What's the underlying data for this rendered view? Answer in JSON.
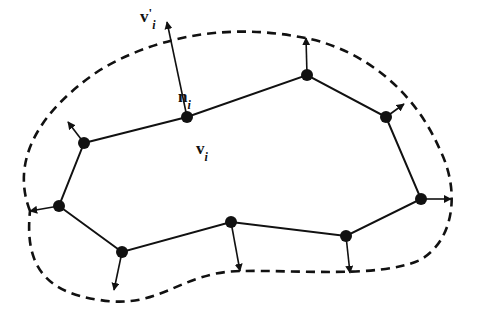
{
  "diagram": {
    "type": "snake-contour-normal-displacement",
    "colors": {
      "stroke": "#111111",
      "background": "#ffffff",
      "node": "#111111"
    },
    "nodes": [
      {
        "id": "v1",
        "x": 84,
        "y": 143
      },
      {
        "id": "v2",
        "x": 187,
        "y": 117
      },
      {
        "id": "v3",
        "x": 307,
        "y": 75
      },
      {
        "id": "v4",
        "x": 386,
        "y": 117
      },
      {
        "id": "v5",
        "x": 421,
        "y": 199
      },
      {
        "id": "v6",
        "x": 346,
        "y": 236
      },
      {
        "id": "v7",
        "x": 231,
        "y": 222
      },
      {
        "id": "v8",
        "x": 122,
        "y": 252
      },
      {
        "id": "v9",
        "x": 59,
        "y": 206
      }
    ],
    "normals": [
      {
        "from": "v1",
        "to": [
          68,
          122
        ]
      },
      {
        "from": "v2",
        "to": [
          167,
          22
        ]
      },
      {
        "from": "v3",
        "to": [
          306,
          38
        ]
      },
      {
        "from": "v4",
        "to": [
          404,
          104
        ]
      },
      {
        "from": "v5",
        "to": [
          451,
          199
        ]
      },
      {
        "from": "v6",
        "to": [
          350,
          273
        ]
      },
      {
        "from": "v7",
        "to": [
          240,
          271
        ]
      },
      {
        "from": "v8",
        "to": [
          114,
          290
        ]
      },
      {
        "from": "v9",
        "to": [
          30,
          211
        ]
      }
    ],
    "dashed_contour": "M 30 211 C 10 160, 40 110, 100 70 C 150 40, 220 22, 300 37 C 350 45, 410 80, 440 150 C 460 190, 455 240, 420 260 C 380 278, 300 270, 240 271 C 180 272, 160 310, 100 300 C 40 292, 25 260, 30 211 Z",
    "labels": {
      "v_prime": {
        "base": "v",
        "prime": "'",
        "sub": "i",
        "x": 140,
        "y": 8
      },
      "n": {
        "base": "n",
        "sub": "i",
        "x": 178,
        "y": 88
      },
      "v": {
        "base": "v",
        "sub": "i",
        "x": 196,
        "y": 140
      }
    }
  }
}
